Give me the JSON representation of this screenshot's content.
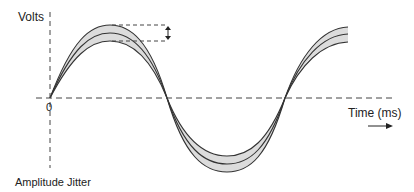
{
  "diagram": {
    "caption": "Amplitude Jitter",
    "y_axis_label": "Volts",
    "x_axis_label": "Time (ms)",
    "origin_label": "0",
    "colors": {
      "line": "#333333",
      "band_fill": "#d9d9d9",
      "axis": "#444444",
      "text": "#222222"
    },
    "waveform": {
      "type": "sine with amplitude jitter band",
      "curves": [
        "upper envelope",
        "nominal",
        "lower envelope"
      ],
      "cycles_shown": 1.5
    },
    "annotation": "double-headed arrow indicating amplitude variation at peak"
  }
}
